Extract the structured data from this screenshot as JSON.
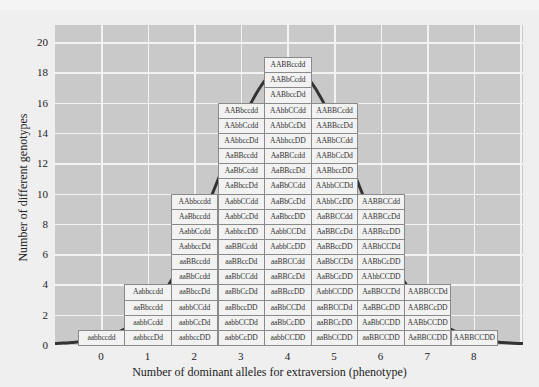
{
  "chart_data": {
    "type": "bar",
    "title": "",
    "xlabel": "Number of dominant alleles for extraversion (phenotype)",
    "ylabel": "Number of different genotypes",
    "categories": [
      "0",
      "1",
      "2",
      "3",
      "4",
      "5",
      "6",
      "7",
      "8"
    ],
    "values": [
      1,
      4,
      10,
      16,
      19,
      16,
      10,
      4,
      1
    ],
    "ylim": [
      0,
      20
    ],
    "yticks": [
      0,
      2,
      4,
      6,
      8,
      10,
      12,
      14,
      16,
      18,
      20
    ],
    "grid": true,
    "overlay": "normal distribution curve",
    "genotypes": {
      "0": [
        "aabbccdd"
      ],
      "1": [
        "Aabbccdd",
        "aaBbccdd",
        "aabbCcdd",
        "aabbccDd"
      ],
      "2": [
        "AAbbccdd",
        "AaBbccdd",
        "AabbCcdd",
        "AabbccDd",
        "aaBBccdd",
        "aaBbCcdd",
        "aaBbccDd",
        "aabbCCdd",
        "aabbCcDd",
        "aabbccDD"
      ],
      "3": [
        "AABbccdd",
        "AAbbCcdd",
        "AAbbccDd",
        "AaBBccdd",
        "AaBbCcdd",
        "AaBbccDd",
        "AabbCCdd",
        "AabbCcDd",
        "AabbccDD",
        "aaBBCcdd",
        "aaBBccDd",
        "aaBbCCdd",
        "aaBbCcDd",
        "aaBbccDD",
        "aabbCCDd",
        "aabbCcDD"
      ],
      "4": [
        "AABBccdd",
        "AABbCcdd",
        "AABbccDd",
        "AAbbCCdd",
        "AAbbCcDd",
        "AAbbccDD",
        "AaBBCcdd",
        "AaBBccDd",
        "AaBbCCdd",
        "AaBbCcDd",
        "AaBbccDD",
        "AabbCCDd",
        "AabbCcDD",
        "aaBBCCdd",
        "aaBBCcDd",
        "aaBBccDD",
        "aaBbCCDd",
        "aaBbCcDD",
        "aabbCCDD"
      ],
      "5": [
        "AABBCcdd",
        "AABBccDd",
        "AABbCCdd",
        "AABbCcDd",
        "AABbccDD",
        "AAbbCCDd",
        "AAbbCcDD",
        "AaBBCCdd",
        "AaBBCcDd",
        "AaBBccDD",
        "AaBbCCDd",
        "AaBbCcDD",
        "AabbCCDD",
        "aaBBCCDd",
        "aaBBCcDD",
        "aaBbCCDD"
      ],
      "6": [
        "AABBCCdd",
        "AABBCcDd",
        "AABBccDD",
        "AABbCCDd",
        "AABbCcDD",
        "AAbbCCDD",
        "AaBBCCDd",
        "AaBBCcDD",
        "AaBbCCDD",
        "aaBBCCDD"
      ],
      "7": [
        "AABBCCDd",
        "AABBCcDD",
        "AABbCCDD",
        "AaBBCCDD"
      ],
      "8": [
        "AABBCCDD"
      ]
    },
    "colors": {
      "plot_bg": "#c9c9c9",
      "grid": "#f3f3f3",
      "cell_bg": "#f2f2f2",
      "curve": "#333333"
    }
  }
}
